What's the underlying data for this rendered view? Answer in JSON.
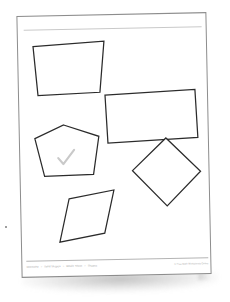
{
  "document": {
    "title": "Geometry Shapes Worksheet",
    "page_background": "#ffffff",
    "sheet_border_color": "#8d8d8d",
    "shape_stroke_color": "#2b2b2b",
    "check_mark_color": "#c9c9c9"
  },
  "header": {
    "rule_visible": true,
    "rule_color": "#c9c9c9"
  },
  "shapes": [
    {
      "name": "trapezoid",
      "label": "Trapezoid",
      "points": "15,30 86,26 81,77 19,79",
      "marked": false
    },
    {
      "name": "rectangle",
      "label": "Rectangle",
      "points": "86,80 176,76 178,124 88,128",
      "marked": false
    },
    {
      "name": "pentagon",
      "label": "Pentagon",
      "points": "44,109 79,121 73,159 24,160 15,122",
      "marked": true,
      "check_path": "M 38,142 L 43,148 L 54,134"
    },
    {
      "name": "diamond",
      "label": "Diamond",
      "points": "112,156 146,124 180,158 146,192",
      "marked": false
    },
    {
      "name": "rhombus",
      "label": "Rhombus",
      "points": "48,183 93,175 83,218 38,226",
      "marked": false
    }
  ],
  "footer": {
    "breadcrumb": [
      "Geometry",
      "Solid Shapes",
      "Whole Sheet",
      "Shapes"
    ],
    "separator": "»",
    "credit": "© Free Math Worksheets Online"
  }
}
